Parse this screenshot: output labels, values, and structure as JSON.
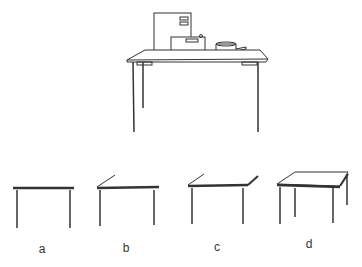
{
  "figure": {
    "main_scene": {
      "description": "Table with computer case, typewriter/box and saucepan on top",
      "objects": [
        "computer-case",
        "box-device",
        "saucepan",
        "table"
      ]
    },
    "variants": [
      {
        "label": "a",
        "description": "Table front view, flat top"
      },
      {
        "label": "b",
        "description": "Table with top slanted up at left"
      },
      {
        "label": "c",
        "description": "Table with slanted top at both ends"
      },
      {
        "label": "d",
        "description": "Table in perspective, four legs"
      }
    ],
    "colors": {
      "stroke": "#333333",
      "background": "#ffffff"
    }
  }
}
